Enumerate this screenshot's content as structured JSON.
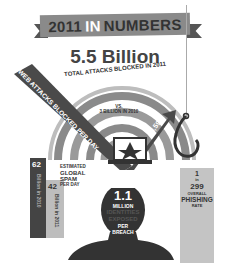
{
  "header": {
    "year": "2011",
    "in": "IN",
    "numbers": "NUMBERS"
  },
  "total_attacks": {
    "value": "5.5 Billion",
    "label": "TOTAL ATTACKS BLOCKED IN 2011",
    "comparison_vs": "VS.",
    "comparison": "3 BILLION IN 2010"
  },
  "web_attacks": {
    "label": "WEB ATTACKS BLOCKED PER DAY",
    "value": "4,595"
  },
  "spam": {
    "label_lines": [
      "ESTIMATED",
      "GLOBAL",
      "SPAM",
      "PER DAY"
    ],
    "bar_2010": {
      "value": "62",
      "caption": "Billion in 2010"
    },
    "bar_2011": {
      "value": "42",
      "caption": "Billion in 2011"
    }
  },
  "identities": {
    "value": "1.1",
    "line1": "MILLION",
    "line2": "IDENTITIES",
    "line3": "EXPOSED",
    "line4": "PER",
    "line5": "BREACH"
  },
  "phishing": {
    "value_top": "1",
    "in": "in",
    "value_bottom": "299",
    "line1": "OVERALL",
    "line2": "PHISHING",
    "line3": "RATE"
  },
  "colors": {
    "dark": "#333333",
    "mid": "#8a8a8a",
    "light": "#bdbdbd"
  }
}
